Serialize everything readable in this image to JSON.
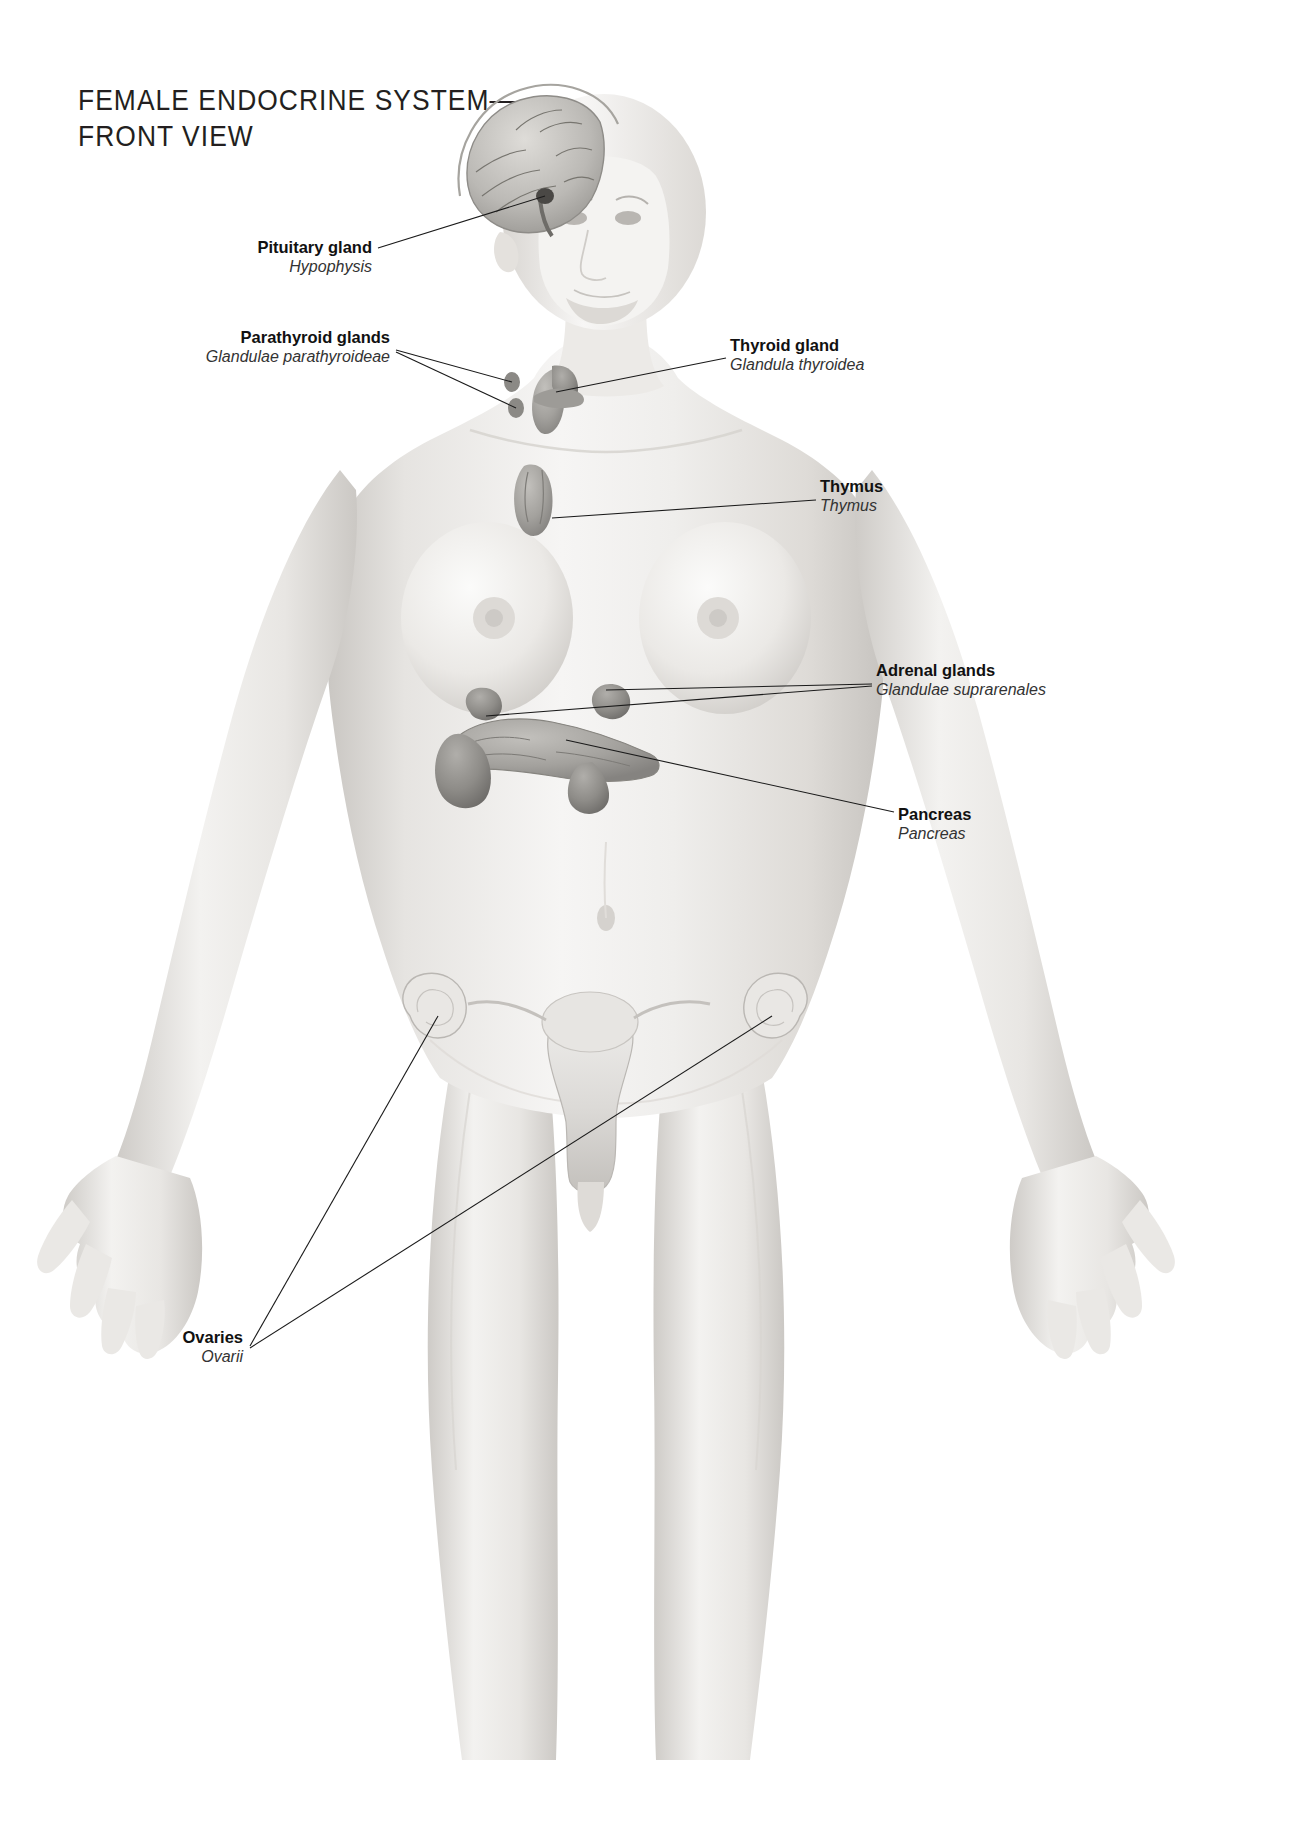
{
  "document": {
    "title_line1": "FEMALE ENDOCRINE SYSTEM—",
    "title_line2": "FRONT VIEW",
    "subject": "female-anatomical-figure-front-view",
    "style": "grayscale-medical-illustration"
  },
  "labels": [
    {
      "id": "pituitary",
      "en": "Pituitary gland",
      "la": "Hypophysis",
      "align": "right",
      "x": 372,
      "y": 238
    },
    {
      "id": "parathyroid",
      "en": "Parathyroid glands",
      "la": "Glandulae parathyroideae",
      "align": "right",
      "x": 390,
      "y": 328
    },
    {
      "id": "thyroid",
      "en": "Thyroid gland",
      "la": "Glandula thyroidea",
      "align": "left",
      "x": 730,
      "y": 336
    },
    {
      "id": "thymus",
      "en": "Thymus",
      "la": "Thymus",
      "align": "left",
      "x": 820,
      "y": 477
    },
    {
      "id": "adrenal",
      "en": "Adrenal glands",
      "la": "Glandulae suprarenales",
      "align": "left",
      "x": 876,
      "y": 661
    },
    {
      "id": "pancreas",
      "en": "Pancreas",
      "la": "Pancreas",
      "align": "left",
      "x": 898,
      "y": 805
    },
    {
      "id": "ovaries",
      "en": "Ovaries",
      "la": "Ovarii",
      "align": "right",
      "x": 243,
      "y": 1328
    }
  ],
  "organs": [
    {
      "id": "brain",
      "name": "brain-sagittal-section"
    },
    {
      "id": "pituitary-gland",
      "name": "pituitary-gland"
    },
    {
      "id": "thyroid-gland",
      "name": "thyroid-gland"
    },
    {
      "id": "parathyroid-glands",
      "name": "parathyroid-glands"
    },
    {
      "id": "thymus-gland",
      "name": "thymus-gland"
    },
    {
      "id": "adrenal-glands",
      "name": "adrenal-glands"
    },
    {
      "id": "pancreas-organ",
      "name": "pancreas"
    },
    {
      "id": "uterus",
      "name": "uterus"
    },
    {
      "id": "ovary-left",
      "name": "ovary-left"
    },
    {
      "id": "ovary-right",
      "name": "ovary-right"
    }
  ],
  "colors": {
    "background": "#ffffff",
    "ink": "#1a1a1a",
    "title": "#231f20",
    "skin_light": "#f2f1ef",
    "skin_mid": "#e2e0dd",
    "skin_shadow": "#c9c6c2",
    "organ_gray": "#a9a7a3",
    "organ_dark": "#8e8c88",
    "brain_gray": "#b9b7b3"
  }
}
